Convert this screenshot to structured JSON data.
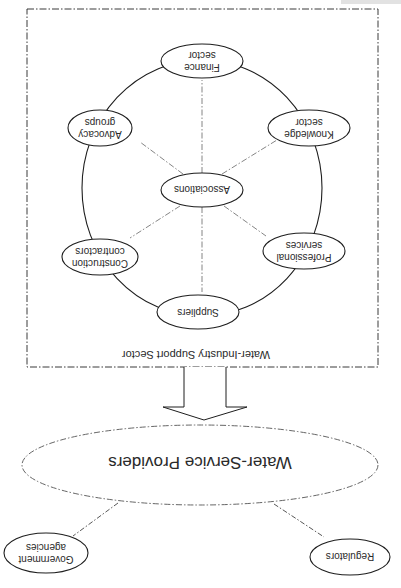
{
  "diagram": {
    "orientation": "rotated-180",
    "support_sector": {
      "label": "Water-Industry Support Sector",
      "center_node": "Associations",
      "ring_nodes": [
        {
          "id": "finance",
          "line1": "Finance",
          "line2": "sector"
        },
        {
          "id": "knowledge",
          "line1": "Knowledge",
          "line2": "sector"
        },
        {
          "id": "professional",
          "line1": "Professional",
          "line2": "services"
        },
        {
          "id": "suppliers",
          "line1": "Suppliers",
          "line2": ""
        },
        {
          "id": "construction",
          "line1": "Construction",
          "line2": "contractors"
        },
        {
          "id": "advocacy",
          "line1": "Advocacy",
          "line2": "groups"
        }
      ]
    },
    "providers": {
      "label": "Water-Service Providers"
    },
    "external": [
      {
        "id": "government",
        "line1": "Government",
        "line2": "agencies"
      },
      {
        "id": "regulators",
        "line1": "Regulators",
        "line2": ""
      }
    ],
    "colors": {
      "stroke": "#1e1e1e",
      "dashed": "#6b6b6b",
      "text": "#2a2a2a",
      "background": "#ffffff"
    }
  }
}
